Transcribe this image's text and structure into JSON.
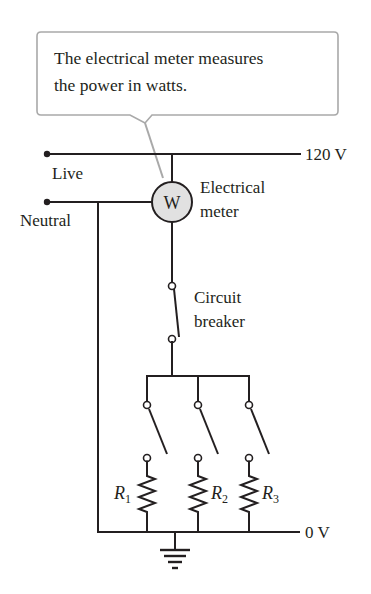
{
  "callout": {
    "line1": "The electrical meter measures",
    "line2": "the power in watts."
  },
  "labels": {
    "live": "Live",
    "neutral": "Neutral",
    "live_voltage": "120 V",
    "ground_voltage": "0 V",
    "meter_symbol": "W",
    "meter_line1": "Electrical",
    "meter_line2": "meter",
    "breaker_line1": "Circuit",
    "breaker_line2": "breaker"
  },
  "resistors": [
    {
      "letter": "R",
      "sub": "1"
    },
    {
      "letter": "R",
      "sub": "2"
    },
    {
      "letter": "R",
      "sub": "3"
    }
  ],
  "colors": {
    "ink": "#231f20",
    "callout_border": "#a9a9a9",
    "meter_fill": "#e1e1e1"
  }
}
